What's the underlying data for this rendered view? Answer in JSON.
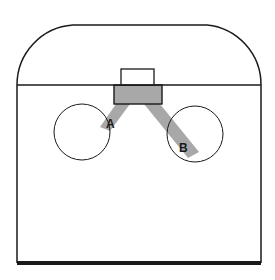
{
  "diagram": {
    "title": "",
    "colors": {
      "line": "#1a1a1a",
      "shade": "#a8a8a8",
      "background": "#ffffff"
    },
    "labels": {
      "a": "A",
      "b": "B"
    },
    "elements": [
      {
        "id": "outer-outline",
        "type": "rounded-top-rectangle"
      },
      {
        "id": "divider-line",
        "type": "horizontal-line"
      },
      {
        "id": "top-box",
        "type": "rectangle"
      },
      {
        "id": "shaded-box",
        "type": "rectangle",
        "shaded": true
      },
      {
        "id": "left-circle",
        "type": "circle"
      },
      {
        "id": "right-circle",
        "type": "circle"
      },
      {
        "id": "strip-a",
        "type": "shaded-strip",
        "label": "A"
      },
      {
        "id": "strip-b",
        "type": "shaded-strip",
        "label": "B"
      }
    ]
  }
}
